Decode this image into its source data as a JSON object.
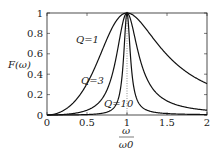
{
  "chart_data": {
    "type": "line",
    "title": "",
    "xlabel": "ω/ω0",
    "ylabel": "F(ω)",
    "xlim": [
      0,
      2
    ],
    "ylim": [
      0,
      1
    ],
    "xticks": [
      "0",
      "0.5",
      "1",
      "1.5",
      "2"
    ],
    "yticks": [
      "0",
      "0.2",
      "0.4",
      "0.6",
      "0.8",
      "1"
    ],
    "grid": false,
    "vertical_reference_line": {
      "x": 1,
      "style": "dotted"
    },
    "series": [
      {
        "name": "Q=1",
        "Q": 1,
        "formula": "1/(1+Q^2(x-1/x)^2)"
      },
      {
        "name": "Q=3",
        "Q": 3,
        "formula": "1/(1+Q^2(x-1/x)^2)"
      },
      {
        "name": "Q=10",
        "Q": 10,
        "formula": "1/(1+Q^2(x-1/x)^2)"
      }
    ],
    "annotations": [
      "Q=1",
      "Q=3",
      "Q=10"
    ]
  },
  "labels": {
    "ylabel": "F(ω)",
    "xlabel_num": "ω",
    "xlabel_den": "ω0",
    "q1": "Q=1",
    "q3": "Q=3",
    "q10": "Q=10"
  }
}
